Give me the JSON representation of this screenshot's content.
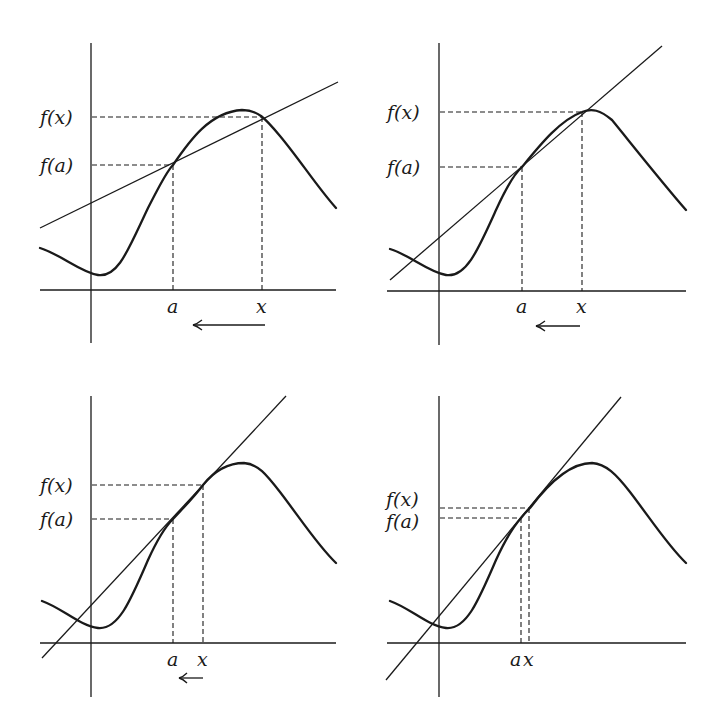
{
  "figure": {
    "panels": [
      {
        "id": "panel-1",
        "labels": {
          "fx": "f(x)",
          "fa": "f(a)",
          "a": "a",
          "x": "x"
        },
        "arrow_direction": "left"
      },
      {
        "id": "panel-2",
        "labels": {
          "fx": "f(x)",
          "fa": "f(a)",
          "a": "a",
          "x": "x"
        },
        "arrow_direction": "left"
      },
      {
        "id": "panel-3",
        "labels": {
          "fx": "f(x)",
          "fa": "f(a)",
          "a": "a",
          "x": "x"
        },
        "arrow_direction": "left"
      },
      {
        "id": "panel-4",
        "labels": {
          "fx": "f(x)",
          "fa": "f(a)",
          "a": "a",
          "x": "x"
        },
        "arrow_direction": "none"
      }
    ]
  }
}
